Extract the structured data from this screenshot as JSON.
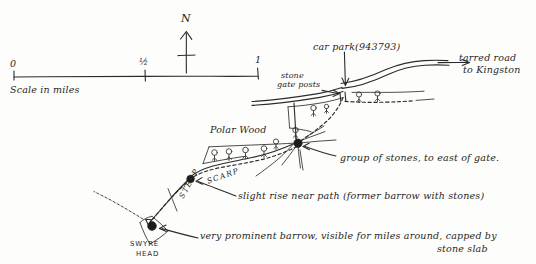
{
  "scale_bar": {
    "tick_zero": "0",
    "tick_half": "½",
    "tick_one": "1",
    "caption": "Scale in miles"
  },
  "compass": {
    "north_label": "N"
  },
  "labels": {
    "car_park": "car park(943793)",
    "tarred_road_line1": "tarred road",
    "tarred_road_line2": "to Kingston",
    "stone_gate_posts_line1": "stone",
    "stone_gate_posts_line2": "gate posts",
    "polar_wood": "Polar Wood",
    "group_of_stones": "group of stones, to east of gate.",
    "slight_rise": "slight rise near path (former barrow with stones)",
    "prominent_barrow_line1": "very prominent barrow, visible for miles around, capped by",
    "prominent_barrow_line2": "stone slab",
    "scarp": "SCARP",
    "steep": "STEEP",
    "swyre_head_line1": "SWYRE",
    "swyre_head_line2": "HEAD"
  },
  "map_features": {
    "roads": [
      "tarred road to Kingston",
      "minor road west of gate posts"
    ],
    "tracks": [
      "dashed footpath from car park to Swyre Head"
    ],
    "woodland": [
      "Polar Wood"
    ],
    "point_markers": [
      {
        "name": "car park",
        "grid_ref": "943793"
      },
      {
        "name": "group of stones",
        "note": "to east of gate"
      },
      {
        "name": "slight rise near path",
        "note": "former barrow with stones"
      },
      {
        "name": "Swyre Head barrow",
        "note": "capped by stone slab"
      }
    ],
    "terrain": [
      "SCARP",
      "STEEP"
    ],
    "trig_point": "triangle symbol at Swyre Head"
  },
  "colors": {
    "ink": "#2b2b2b",
    "paper": "#fdfdfb"
  }
}
